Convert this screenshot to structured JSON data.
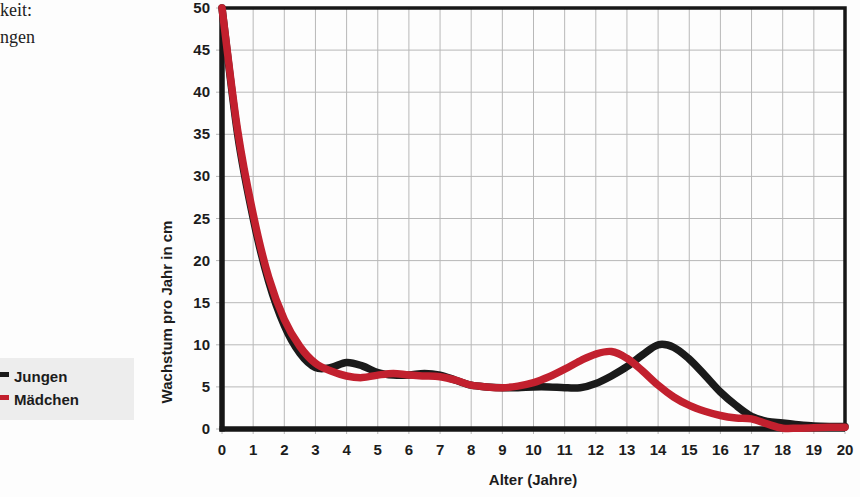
{
  "page_text": {
    "line1": "keit:",
    "line2": "ngen"
  },
  "legend": {
    "items": [
      {
        "label": "Jungen",
        "color": "#1a1a1a"
      },
      {
        "label": "Mädchen",
        "color": "#c2202e"
      }
    ]
  },
  "chart_data": {
    "type": "line",
    "title": "",
    "xlabel": "Alter (Jahre)",
    "ylabel": "Wachstum pro Jahr in cm",
    "xlim": [
      0,
      20
    ],
    "ylim": [
      0,
      50
    ],
    "xticks": [
      0,
      1,
      2,
      3,
      4,
      5,
      6,
      7,
      8,
      9,
      10,
      11,
      12,
      13,
      14,
      15,
      16,
      17,
      18,
      19,
      20
    ],
    "yticks": [
      0,
      5,
      10,
      15,
      20,
      25,
      30,
      35,
      40,
      45,
      50
    ],
    "grid": true,
    "grid_color": "#b8b8b8",
    "axis_color": "#161616",
    "line_width": 7.5,
    "legend_position": "outside-left",
    "x": [
      0,
      0.5,
      1,
      1.5,
      2,
      2.5,
      3,
      3.5,
      4,
      4.5,
      5,
      5.5,
      6,
      6.5,
      7,
      7.5,
      8,
      8.5,
      9,
      9.5,
      10,
      10.5,
      11,
      11.5,
      12,
      12.5,
      13,
      13.5,
      14,
      14.5,
      15,
      15.5,
      16,
      16.5,
      17,
      17.5,
      18,
      18.5,
      19,
      19.5,
      20
    ],
    "series": [
      {
        "name": "Jungen",
        "color": "#1a1a1a",
        "values": [
          50,
          35,
          25,
          17.5,
          12.3,
          9.0,
          7.3,
          7.3,
          7.9,
          7.5,
          6.7,
          6.4,
          6.4,
          6.6,
          6.4,
          5.8,
          5.2,
          5.0,
          4.9,
          4.9,
          5.0,
          5.0,
          4.9,
          4.9,
          5.4,
          6.3,
          7.4,
          8.8,
          10.0,
          9.7,
          8.3,
          6.4,
          4.4,
          2.8,
          1.5,
          0.9,
          0.7,
          0.5,
          0.35,
          0.3,
          0.3
        ]
      },
      {
        "name": "Mädchen",
        "color": "#c2202e",
        "values": [
          50,
          35.5,
          25.5,
          18,
          13,
          9.8,
          7.8,
          6.9,
          6.3,
          6.1,
          6.4,
          6.6,
          6.4,
          6.3,
          6.2,
          5.8,
          5.2,
          5.0,
          4.9,
          5.1,
          5.5,
          6.2,
          7.1,
          8.1,
          8.9,
          9.2,
          8.4,
          6.9,
          5.2,
          3.8,
          2.8,
          2.1,
          1.6,
          1.3,
          1.2,
          0.6,
          0.1,
          0.1,
          0.15,
          0.2,
          0.2
        ]
      }
    ]
  }
}
